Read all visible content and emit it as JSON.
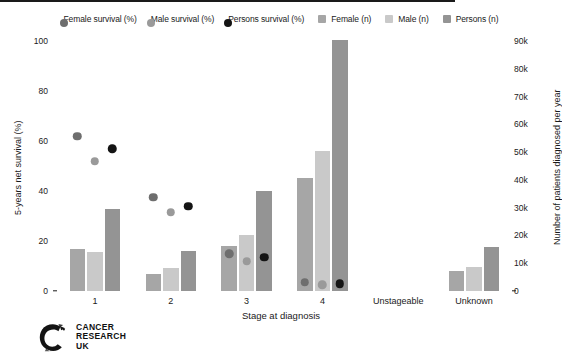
{
  "chart_data": {
    "type": "bar",
    "title": "",
    "subtitle": "",
    "xlabel": "Stage at diagnosis",
    "ylabel": "5-years net survival (%)",
    "ylabel_right": "Number of patients diagnosed per year",
    "categories": [
      "1",
      "2",
      "3",
      "4",
      "Unstageable",
      "Unknown"
    ],
    "ylim": [
      0,
      100
    ],
    "yticks": [
      "0",
      "20",
      "40",
      "60",
      "80",
      "100"
    ],
    "ytick_values": [
      0,
      20,
      40,
      60,
      80,
      100
    ],
    "ylim_right": [
      0,
      90000
    ],
    "yticks_right": [
      "0",
      "10k",
      "20k",
      "30k",
      "40k",
      "50k",
      "60k",
      "70k",
      "80k",
      "90k"
    ],
    "ytick_values_right": [
      0,
      10000,
      20000,
      30000,
      40000,
      50000,
      60000,
      70000,
      80000,
      90000
    ],
    "grid": false,
    "legend_position": "top",
    "series": [
      {
        "name": "Female survival (%)",
        "type": "scatter",
        "axis": "left",
        "color": "#6e6e6e",
        "values": [
          62,
          37.5,
          15,
          3.5,
          null,
          null
        ]
      },
      {
        "name": "Male survival (%)",
        "type": "scatter",
        "axis": "left",
        "color": "#9a9a9a",
        "values": [
          52,
          31.5,
          12,
          2.5,
          null,
          null
        ]
      },
      {
        "name": "Persons survival (%)",
        "type": "scatter",
        "axis": "left",
        "color": "#141414",
        "values": [
          57,
          34,
          13.5,
          3,
          null,
          null
        ]
      },
      {
        "name": "Female (n)",
        "type": "bar",
        "axis": "right",
        "color": "#a6a6a6",
        "values": [
          15300,
          6100,
          16200,
          40700,
          0,
          7100
        ]
      },
      {
        "name": "Male (n)",
        "type": "bar",
        "axis": "right",
        "color": "#c9c9c9",
        "values": [
          14200,
          8400,
          20300,
          50400,
          0,
          8600
        ]
      },
      {
        "name": "Persons (n)",
        "type": "bar",
        "axis": "right",
        "color": "#949494",
        "values": [
          29500,
          14500,
          36000,
          90500,
          0,
          15700
        ]
      }
    ]
  },
  "legend": {
    "items": [
      {
        "label": "Female survival (%)",
        "marker": "dot",
        "color": "#6e6e6e"
      },
      {
        "label": "Male survival (%)",
        "marker": "dot",
        "color": "#9a9a9a"
      },
      {
        "label": "Persons survival (%)",
        "marker": "dot",
        "color": "#141414"
      },
      {
        "label": "Female (n)",
        "marker": "square",
        "color": "#a6a6a6"
      },
      {
        "label": "Male (n)",
        "marker": "square",
        "color": "#c9c9c9"
      },
      {
        "label": "Persons (n)",
        "marker": "square",
        "color": "#949494"
      }
    ]
  },
  "logo": {
    "line1": "CANCER",
    "line2": "RESEARCH",
    "line3": "UK",
    "icon": "cruk-c-logo"
  }
}
